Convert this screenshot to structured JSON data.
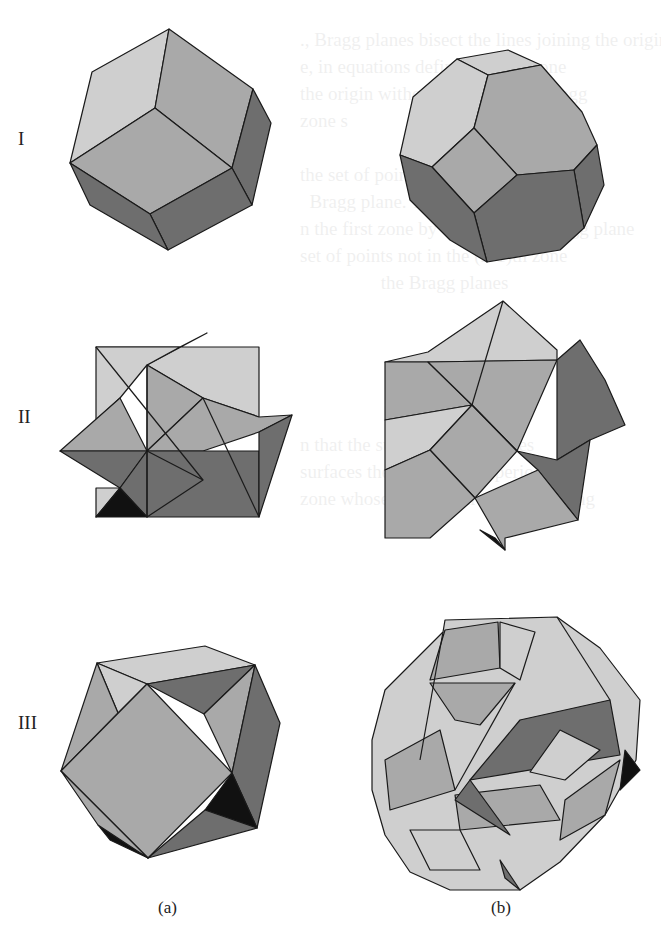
{
  "figure": {
    "rows": [
      {
        "label": "I",
        "a": "rhombic-dodecahedron",
        "b": "truncated-octahedron"
      },
      {
        "label": "II",
        "a": "stellated-cube-octahedron-compound",
        "b": "stellated-polyhedron-zone"
      },
      {
        "label": "III",
        "a": "cuboctahedral-zone-solid",
        "b": "complex-zone-polyhedron"
      }
    ],
    "columns": [
      {
        "caption": "(a)"
      },
      {
        "caption": "(b)"
      }
    ],
    "colors": {
      "light_face": "#cfcfcf",
      "mid_face": "#a9a9a9",
      "dark_face": "#6e6e6e",
      "shadow_face": "#111111",
      "edge": "#1a1a1a"
    }
  },
  "bleed_through_text": [
    "., Bragg planes bisect the lines joining the origin to po",
    "e, in equations define the first zone",
    "the origin without crossing any Bragg",
    "zone s                                ns",
    "",
    "the set of points in k-space that ca",
    "  Bragg plane. The second zone is th",
    "n the first zone by crossing one Bragg plane",
    "set of points not in the (n-1)th zone",
    "                 the Bragg planes",
    "",
    "",
    "",
    "",
    "",
    "n that the surfaces of the zones",
    "surfaces the sheets of the periodic",
    "zone whose interiors are the remaining"
  ]
}
